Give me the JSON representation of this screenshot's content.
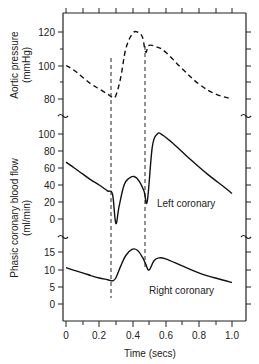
{
  "chart_data": [
    {
      "type": "line",
      "panel": "top",
      "ylabel": "Aortic pressure (mmHg)",
      "ylabel_lines": [
        "Aortic pressure",
        "(mmHg)"
      ],
      "yticks": [
        80,
        100,
        120
      ],
      "ylim": [
        72,
        128
      ],
      "line_style": "dashed",
      "series": [
        {
          "name": "Aortic pressure",
          "x": [
            0.0,
            0.05,
            0.1,
            0.15,
            0.2,
            0.25,
            0.28,
            0.3,
            0.33,
            0.36,
            0.4,
            0.43,
            0.46,
            0.48,
            0.5,
            0.55,
            0.6,
            0.7,
            0.8,
            0.9,
            1.0
          ],
          "y": [
            100,
            97,
            93,
            89,
            86,
            83,
            81,
            82,
            93,
            110,
            119,
            120,
            117,
            108,
            112,
            111,
            108,
            98,
            89,
            83,
            80
          ]
        }
      ]
    },
    {
      "type": "line",
      "panel": "middle",
      "ylabel": "Phasic coronary blood flow (ml/min)",
      "yticks": [
        0,
        20,
        40,
        60,
        80,
        100
      ],
      "ylim": [
        -15,
        110
      ],
      "annotation": "Left coronary",
      "series": [
        {
          "name": "Left coronary",
          "x": [
            0.0,
            0.05,
            0.1,
            0.15,
            0.2,
            0.25,
            0.28,
            0.3,
            0.32,
            0.35,
            0.38,
            0.41,
            0.44,
            0.47,
            0.49,
            0.52,
            0.55,
            0.58,
            0.65,
            0.75,
            0.85,
            0.95,
            1.0
          ],
          "y": [
            67,
            60,
            53,
            46,
            40,
            33,
            29,
            -5,
            15,
            40,
            48,
            50,
            45,
            33,
            21,
            85,
            100,
            99,
            88,
            70,
            53,
            38,
            30
          ]
        }
      ]
    },
    {
      "type": "line",
      "panel": "bottom",
      "ylabel": "Phasic coronary blood flow (ml/min)",
      "yticks": [
        0,
        5,
        10,
        15
      ],
      "ylim": [
        -5,
        20
      ],
      "annotation": "Right coronary",
      "series": [
        {
          "name": "Right coronary",
          "x": [
            0.0,
            0.05,
            0.1,
            0.15,
            0.2,
            0.25,
            0.28,
            0.3,
            0.33,
            0.36,
            0.4,
            0.43,
            0.46,
            0.48,
            0.5,
            0.53,
            0.56,
            0.6,
            0.7,
            0.8,
            0.9,
            1.0
          ],
          "y": [
            10.5,
            9.7,
            9.0,
            8.2,
            7.5,
            7.0,
            6.7,
            7.5,
            11,
            14,
            15.8,
            15.5,
            13.5,
            11.5,
            9.8,
            12.5,
            13.3,
            13,
            11,
            9,
            7.5,
            6.2
          ]
        }
      ]
    }
  ],
  "xaxis": {
    "label": "Time (secs)",
    "ticks": [
      "0",
      "0.2",
      "0.4",
      "0.6",
      "0.8",
      "1.0"
    ],
    "xlim": [
      0,
      1.0
    ]
  },
  "markers": {
    "vertical_dashed_lines_at": [
      0.27,
      0.48
    ]
  },
  "labels": {
    "aortic_line1": "Aortic pressure",
    "aortic_line2": "(mmHg)",
    "flow_line1": "Phasic coronary blood flow",
    "flow_line2": "(ml/min)",
    "left_coronary": "Left coronary",
    "right_coronary": "Right coronary",
    "xlabel": "Time (secs)",
    "y_top": [
      "120",
      "100",
      "80"
    ],
    "y_mid": [
      "100",
      "80",
      "60",
      "40",
      "20",
      "0"
    ],
    "y_bot": [
      "15",
      "10",
      "5",
      "0"
    ],
    "x_ticks": [
      "0",
      "0.2",
      "0.4",
      "0.6",
      "0.8",
      "1.0"
    ]
  }
}
